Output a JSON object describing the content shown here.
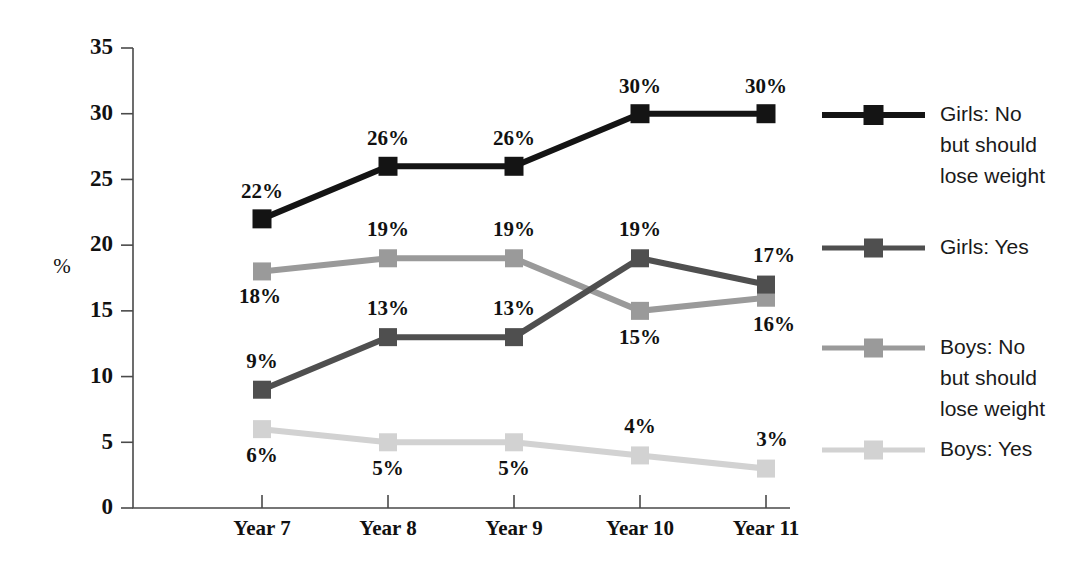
{
  "chart_data": {
    "type": "line",
    "title": "",
    "subtitle": "",
    "xlabel": "",
    "ylabel": "%",
    "categories": [
      "Year 7",
      "Year 8",
      "Year 9",
      "Year 10",
      "Year 11"
    ],
    "ylim": [
      0,
      35
    ],
    "ytick_values": [
      0,
      5,
      10,
      15,
      20,
      25,
      30,
      35
    ],
    "ytick_labels": [
      "0",
      "5",
      "10",
      "15",
      "20",
      "25",
      "30",
      "35"
    ],
    "grid": false,
    "legend_position": "right",
    "value_labels_shown": true,
    "series": [
      {
        "name": "Girls: No but should lose weight",
        "legend_label_lines": [
          "Girls: No",
          "but should",
          "lose weight"
        ],
        "color": "#141414",
        "line_width": 6,
        "marker": "square",
        "marker_size": 19,
        "values": [
          22,
          26,
          26,
          30,
          30
        ],
        "value_labels": [
          "22%",
          "26%",
          "26%",
          "30%",
          "30%"
        ],
        "label_side": "above"
      },
      {
        "name": "Girls: Yes",
        "legend_label_lines": [
          "Girls: Yes"
        ],
        "color": "#4f4f4f",
        "line_width": 6,
        "marker": "square",
        "marker_size": 18,
        "values": [
          9,
          13,
          13,
          19,
          17
        ],
        "value_labels": [
          "9%",
          "13%",
          "13%",
          "19%",
          "17%"
        ],
        "label_side": "above"
      },
      {
        "name": "Boys: No but should lose weight",
        "legend_label_lines": [
          "Boys: No",
          "but should",
          "lose weight"
        ],
        "color": "#9a9a9a",
        "line_width": 6,
        "marker": "square",
        "marker_size": 18,
        "values": [
          18,
          19,
          19,
          15,
          16
        ],
        "value_labels": [
          "18%",
          "19%",
          "19%",
          "15%",
          "16%"
        ],
        "label_side": "mixed"
      },
      {
        "name": "Boys: Yes",
        "legend_label_lines": [
          "Boys: Yes"
        ],
        "color": "#d2d2d2",
        "line_width": 6,
        "marker": "square",
        "marker_size": 18,
        "values": [
          6,
          5,
          5,
          4,
          3
        ],
        "value_labels": [
          "6%",
          "5%",
          "5%",
          "4%",
          "3%"
        ],
        "label_side": "below"
      }
    ],
    "label_offsets": [
      [
        [
          0,
          -26
        ],
        [
          0,
          -26
        ],
        [
          0,
          -26
        ],
        [
          0,
          -26
        ],
        [
          0,
          -26
        ]
      ],
      [
        [
          0,
          -27
        ],
        [
          0,
          -27
        ],
        [
          0,
          -27
        ],
        [
          0,
          -27
        ],
        [
          8,
          -27
        ]
      ],
      [
        [
          -2,
          27
        ],
        [
          0,
          -27
        ],
        [
          0,
          -27
        ],
        [
          0,
          28
        ],
        [
          8,
          28
        ]
      ],
      [
        [
          0,
          28
        ],
        [
          0,
          28
        ],
        [
          0,
          28
        ],
        [
          0,
          -27
        ],
        [
          6,
          -27
        ]
      ]
    ]
  },
  "plot_geometry": {
    "x_positions": [
      262,
      388,
      514,
      640,
      766
    ],
    "y_zero": 508,
    "y_max": 48,
    "axis_x": 133,
    "axis_bottom_right": 790
  },
  "legend": {
    "entries_y": [
      115,
      248,
      348,
      450
    ],
    "sample_x1": 822,
    "sample_x2": 925,
    "text_x": 940,
    "line_height": 31
  }
}
